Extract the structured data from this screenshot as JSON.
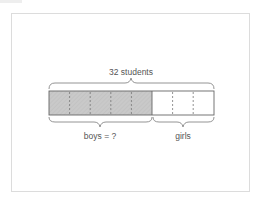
{
  "diagram": {
    "type": "tape-diagram",
    "total_label": "32 students",
    "total": 32,
    "segments_total": 8,
    "segments_shaded": 5,
    "parts": [
      {
        "label": "boys = ?",
        "segments": 5,
        "shaded": true
      },
      {
        "label": "girls",
        "segments": 3,
        "shaded": false
      }
    ],
    "colors": {
      "shaded_fill": "#c9c9c9",
      "outline": "#666666",
      "divider": "#777777",
      "brace": "#888888",
      "text": "#555555",
      "card_border": "#dcdcdc"
    }
  }
}
